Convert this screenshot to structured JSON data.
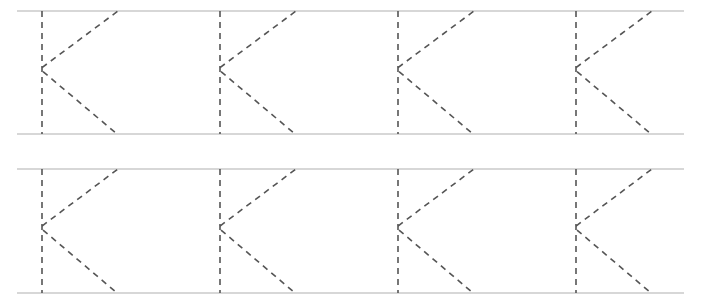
{
  "worksheet": {
    "type": "letter-tracing",
    "letter": "K",
    "rows": 2,
    "letters_per_row": 4,
    "colors": {
      "guide_line": "#b0b0b0",
      "dashed_stroke": "#555555",
      "background": "#ffffff"
    }
  }
}
